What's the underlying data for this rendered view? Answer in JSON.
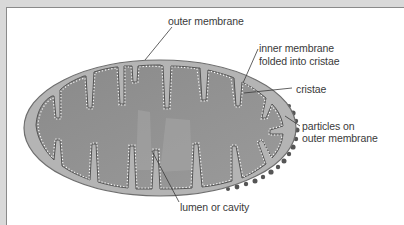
{
  "figure": {
    "labels": {
      "outer_membrane": "outer membrane",
      "inner_membrane_line1": "inner membrane",
      "inner_membrane_line2": "folded into cristae",
      "cristae": "cristae",
      "particles_line1": "particles on",
      "particles_line2": "outer membrane",
      "lumen": "lumen or cavity"
    },
    "colors": {
      "background": "#d9d9d9",
      "panel": "#ffffff",
      "frame_border": "#8a8a8a",
      "outer_membrane_fill": "#b4b4b4",
      "outer_membrane_stroke": "#6e6e6e",
      "matrix_fill": "#8f8f8f",
      "lumen_fill": "#a6a6a6",
      "inner_membrane_dots": "#ffffff",
      "particles": "#555555",
      "leader_lines": "#3a3a3a",
      "label_text": "#3a3a3a"
    }
  }
}
